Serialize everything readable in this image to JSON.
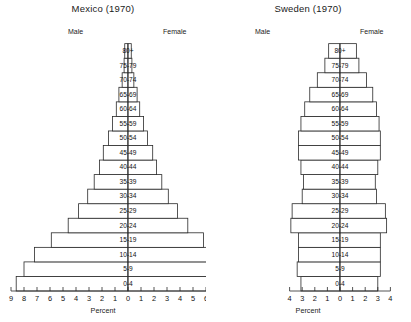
{
  "figure": {
    "axis_title": "Percent",
    "male_label": "Male",
    "female_label": "Female",
    "line_color": "#2a2a2a",
    "bar_fill": "#ffffff",
    "background": "#ffffff"
  },
  "chart_data": [
    {
      "type": "bar",
      "title": "Mexico (1970)",
      "subtype": "population-pyramid",
      "xlabel": "Percent",
      "ylabel": "",
      "grid": false,
      "legend_position": "top-inline",
      "legend": [
        "Male",
        "Female"
      ],
      "xlim": [
        -9,
        9
      ],
      "xticks": [
        -9,
        -8,
        -7,
        -6,
        -5,
        -4,
        -3,
        -2,
        -1,
        0,
        1,
        2,
        3,
        4,
        5,
        6,
        7,
        8,
        9
      ],
      "xticklabels": [
        "9",
        "8",
        "7",
        "6",
        "5",
        "4",
        "3",
        "2",
        "1",
        "0",
        "1",
        "2",
        "3",
        "4",
        "5",
        "6",
        "7",
        "8",
        "9"
      ],
      "categories": [
        "0-4",
        "5-9",
        "10-14",
        "15-19",
        "20-24",
        "25-29",
        "30-34",
        "35-39",
        "40-44",
        "45-49",
        "50-54",
        "55-59",
        "60-64",
        "65-69",
        "70-74",
        "75-79",
        "80+"
      ],
      "series": [
        {
          "name": "Male",
          "values": [
            8.6,
            8.0,
            7.2,
            5.9,
            4.6,
            3.8,
            3.1,
            2.6,
            2.2,
            1.9,
            1.5,
            1.2,
            0.9,
            0.7,
            0.45,
            0.3,
            0.25
          ]
        },
        {
          "name": "Female",
          "values": [
            8.4,
            7.8,
            7.0,
            5.8,
            4.6,
            3.8,
            3.1,
            2.6,
            2.2,
            1.9,
            1.5,
            1.2,
            0.9,
            0.7,
            0.45,
            0.3,
            0.25
          ]
        }
      ]
    },
    {
      "type": "bar",
      "title": "Sweden (1970)",
      "subtype": "population-pyramid",
      "xlabel": "Percent",
      "ylabel": "",
      "grid": false,
      "legend_position": "top-inline",
      "legend": [
        "Male",
        "Female"
      ],
      "xlim": [
        -4,
        4
      ],
      "xticks": [
        -4,
        -3,
        -2,
        -1,
        0,
        1,
        2,
        3,
        4
      ],
      "xticklabels": [
        "4",
        "3",
        "2",
        "1",
        "0",
        "1",
        "2",
        "3",
        "4"
      ],
      "categories": [
        "0-4",
        "5-9",
        "10-14",
        "15-19",
        "20-24",
        "25-29",
        "30-34",
        "35-39",
        "40-44",
        "45-49",
        "50-54",
        "55-59",
        "60-64",
        "65-69",
        "70-74",
        "75-79",
        "80+"
      ],
      "series": [
        {
          "name": "Male",
          "values": [
            3.1,
            3.4,
            3.3,
            3.3,
            3.9,
            3.8,
            3.0,
            2.9,
            3.1,
            3.3,
            3.3,
            3.1,
            2.8,
            2.4,
            1.8,
            1.2,
            0.9
          ]
        },
        {
          "name": "Female",
          "values": [
            3.0,
            3.2,
            3.2,
            3.2,
            3.7,
            3.6,
            2.9,
            2.8,
            3.0,
            3.2,
            3.2,
            3.1,
            2.9,
            2.6,
            2.1,
            1.5,
            1.3
          ]
        }
      ]
    }
  ]
}
